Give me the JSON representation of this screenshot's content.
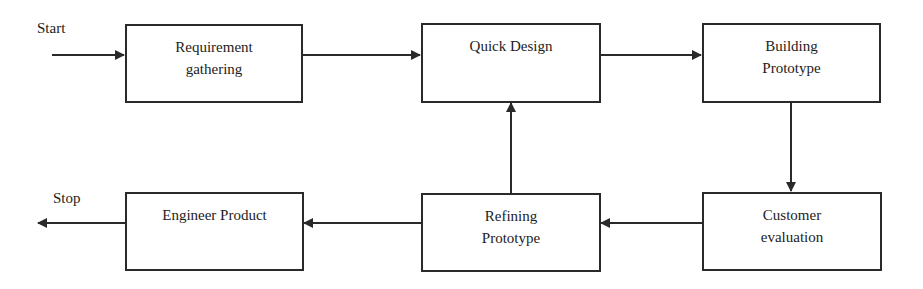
{
  "diagram": {
    "type": "flowchart",
    "line_color": "#2a2a2a",
    "terminals": {
      "start": "Start",
      "stop": "Stop"
    },
    "nodes": [
      {
        "id": "req",
        "line1": "Requirement",
        "line2": "gathering"
      },
      {
        "id": "quick",
        "line1": "Quick Design",
        "line2": ""
      },
      {
        "id": "build",
        "line1": "Building",
        "line2": "Prototype"
      },
      {
        "id": "cust",
        "line1": "Customer",
        "line2": "evaluation"
      },
      {
        "id": "refine",
        "line1": "Refining",
        "line2": "Prototype"
      },
      {
        "id": "eng",
        "line1": "Engineer Product",
        "line2": ""
      }
    ],
    "edges": [
      {
        "from": "Start",
        "to": "req"
      },
      {
        "from": "req",
        "to": "quick"
      },
      {
        "from": "quick",
        "to": "build"
      },
      {
        "from": "build",
        "to": "cust"
      },
      {
        "from": "cust",
        "to": "refine"
      },
      {
        "from": "refine",
        "to": "quick"
      },
      {
        "from": "refine",
        "to": "eng"
      },
      {
        "from": "eng",
        "to": "Stop"
      }
    ]
  }
}
